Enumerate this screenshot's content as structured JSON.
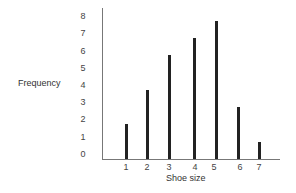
{
  "chart_data": {
    "type": "bar",
    "title": "",
    "xlabel": "Shoe size",
    "ylabel": "Frequency",
    "categories": [
      "1",
      "2",
      "3",
      "4",
      "5",
      "6",
      "7"
    ],
    "values": [
      2,
      4,
      6,
      7,
      8,
      3,
      1
    ],
    "yticks": [
      "0",
      "1",
      "2",
      "3",
      "4",
      "5",
      "6",
      "7",
      "8"
    ],
    "ylim": [
      0,
      8
    ],
    "grid": false,
    "legend": null,
    "bar_color": "#222222"
  }
}
